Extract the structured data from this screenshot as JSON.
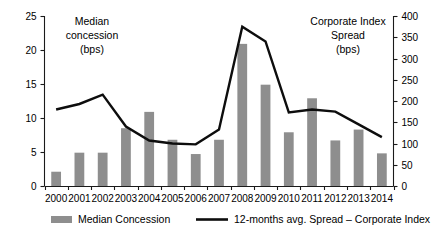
{
  "chart_data": {
    "type": "bar",
    "title": "",
    "categories": [
      "2000",
      "2001",
      "2002",
      "2003",
      "2004",
      "2005",
      "2006",
      "2007",
      "2008",
      "2009",
      "2010",
      "2011",
      "2012",
      "2013",
      "2014"
    ],
    "xlabel": "",
    "grid": false,
    "legend_position": "bottom",
    "left_axis": {
      "label_line1": "Median",
      "label_line2": "concession",
      "label_line3": "(bps)",
      "ylim": [
        0,
        25
      ],
      "ticks": [
        0,
        5,
        10,
        15,
        20,
        25
      ],
      "tick_labels": [
        "0",
        "5",
        "10",
        "15",
        "20",
        "25"
      ]
    },
    "right_axis": {
      "label_line1": "Corporate Index",
      "label_line2": "Spread",
      "label_line3": "(bps)",
      "ylim": [
        0,
        400
      ],
      "ticks": [
        0,
        50,
        100,
        150,
        200,
        250,
        300,
        350,
        400
      ],
      "tick_labels": [
        "0",
        "50",
        "100",
        "150",
        "200",
        "250",
        "300",
        "350",
        "400"
      ]
    },
    "series": [
      {
        "name": "Median Concession",
        "type": "bar",
        "axis": "left",
        "unit": "bps",
        "color": "#8e8e8e",
        "values": [
          2.1,
          4.9,
          4.9,
          8.5,
          10.9,
          6.8,
          4.7,
          6.8,
          20.9,
          14.9,
          7.9,
          12.9,
          6.7,
          8.3,
          4.8
        ]
      },
      {
        "name": "12-months avg. Spread – Corporate Index",
        "type": "line",
        "axis": "right",
        "unit": "bps",
        "color": "#0d0d0d",
        "values": [
          180,
          193,
          215,
          140,
          107,
          100,
          98,
          133,
          375,
          340,
          173,
          180,
          175,
          145,
          115
        ]
      }
    ]
  },
  "legend": {
    "items": [
      {
        "label": "Median Concession",
        "marker": "bar-swatch",
        "color": "#8e8e8e"
      },
      {
        "label": "12-months avg. Spread – Corporate Index",
        "marker": "line-swatch",
        "color": "#0d0d0d"
      }
    ]
  }
}
